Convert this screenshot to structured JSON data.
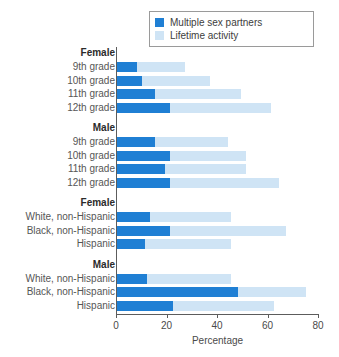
{
  "legend": {
    "position": "top-right",
    "entries": [
      {
        "label": "Multiple sex partners",
        "color": "#1f7fd4",
        "icon": "legend-swatch-dark"
      },
      {
        "label": "Lifetime activity",
        "color": "#cfe4f5",
        "icon": "legend-swatch-light"
      }
    ]
  },
  "axis": {
    "x_title": "Percentage",
    "ticks": [
      "0",
      "20",
      "40",
      "60",
      "80"
    ],
    "min": 0,
    "max": 80
  },
  "colors": {
    "multiple_sex_partners": "#1f7fd4",
    "lifetime_activity": "#cfe4f5",
    "axis": "#5c5c5c",
    "label": "#565656",
    "group_title": "#2b2b2b"
  },
  "chart_data": {
    "type": "bar",
    "orientation": "horizontal",
    "stacked": true,
    "title": "",
    "xlabel": "Percentage",
    "ylabel": "",
    "xlim": [
      0,
      80
    ],
    "xticks": [
      0,
      20,
      40,
      60,
      80
    ],
    "grid": false,
    "legend_position": "top-right",
    "series": [
      {
        "name": "Multiple sex partners",
        "color": "#1f7fd4"
      },
      {
        "name": "Lifetime activity",
        "color": "#cfe4f5"
      }
    ],
    "groups": [
      {
        "title": "Female",
        "categories": [
          "9th grade",
          "10th grade",
          "11th grade",
          "12th grade"
        ],
        "multiple_sex_partners": [
          8,
          10,
          15,
          21
        ],
        "lifetime_activity": [
          27,
          37,
          49,
          61
        ]
      },
      {
        "title": "Male",
        "categories": [
          "9th grade",
          "10th grade",
          "11th grade",
          "12th grade"
        ],
        "multiple_sex_partners": [
          15,
          21,
          19,
          21
        ],
        "lifetime_activity": [
          44,
          51,
          51,
          64
        ]
      },
      {
        "title": "Female",
        "categories": [
          "White, non-Hispanic",
          "Black, non-Hispanic",
          "Hispanic"
        ],
        "multiple_sex_partners": [
          13,
          21,
          11
        ],
        "lifetime_activity": [
          45,
          67,
          45
        ]
      },
      {
        "title": "Male",
        "categories": [
          "White, non-Hispanic",
          "Black, non-Hispanic",
          "Hispanic"
        ],
        "multiple_sex_partners": [
          12,
          48,
          22
        ],
        "lifetime_activity": [
          45,
          75,
          62
        ]
      }
    ]
  }
}
